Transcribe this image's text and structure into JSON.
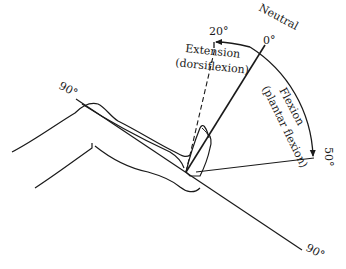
{
  "diagram": {
    "labels": {
      "neutral_word": "Neutral",
      "neutral_angle": "0°",
      "extension_angle": "20°",
      "extension_word": "Extension",
      "extension_sub": "(dorsiflexion)",
      "flexion_word": "Flexion",
      "flexion_sub": "(plantar flexion)",
      "flexion_angle": "50°",
      "leg_angle_top": "90°",
      "leg_angle_bottom": "90°"
    },
    "colors": {
      "line": "#1a1a1a",
      "background": "#ffffff"
    }
  }
}
